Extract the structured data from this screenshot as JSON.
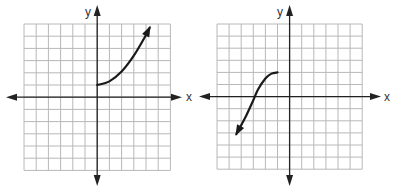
{
  "chart_data": [
    {
      "type": "line",
      "title": "",
      "xlabel": "x",
      "ylabel": "y",
      "xlim": [
        -6,
        6
      ],
      "ylim": [
        -6,
        6
      ],
      "grid": true,
      "grid_step": 1,
      "series": [
        {
          "name": "curve",
          "start_point": {
            "x": 0,
            "y": 1,
            "style": "endpoint"
          },
          "end_arrow": true,
          "points": [
            [
              0,
              1
            ],
            [
              1,
              1.3
            ],
            [
              2,
              2.1
            ],
            [
              3,
              3.4
            ],
            [
              4,
              5.1
            ],
            [
              4.3,
              5.7
            ]
          ]
        }
      ]
    },
    {
      "type": "line",
      "title": "",
      "xlabel": "x",
      "ylabel": "y",
      "xlim": [
        -6,
        6
      ],
      "ylim": [
        -6,
        6
      ],
      "grid": true,
      "grid_step": 1,
      "series": [
        {
          "name": "curve",
          "start_point": {
            "x": -1,
            "y": 2,
            "style": "endpoint"
          },
          "end_arrow": true,
          "points": [
            [
              -1,
              2
            ],
            [
              -1.5,
              1.9
            ],
            [
              -2,
              1.5
            ],
            [
              -2.6,
              0.6
            ],
            [
              -3,
              -0.3
            ],
            [
              -3.6,
              -1.6
            ],
            [
              -4.4,
              -3.1
            ]
          ]
        }
      ]
    }
  ],
  "graphs": [
    {
      "x_label": "x",
      "y_label": "y"
    },
    {
      "x_label": "x",
      "y_label": "y"
    }
  ]
}
